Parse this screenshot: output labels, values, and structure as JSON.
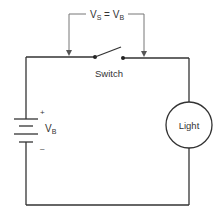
{
  "diagram": {
    "type": "circuit-schematic",
    "voltage_label": {
      "left": "V",
      "left_sub": "S",
      "equals": " = ",
      "right": "V",
      "right_sub": "B"
    },
    "switch": {
      "label": "Switch",
      "state": "open"
    },
    "battery": {
      "label": "V",
      "label_sub": "B",
      "positive_sign": "+",
      "negative_sign": "–"
    },
    "load": {
      "label": "Light"
    },
    "colors": {
      "wire": "#333333",
      "measurement_lead": "#777777",
      "background": "#ffffff"
    }
  }
}
